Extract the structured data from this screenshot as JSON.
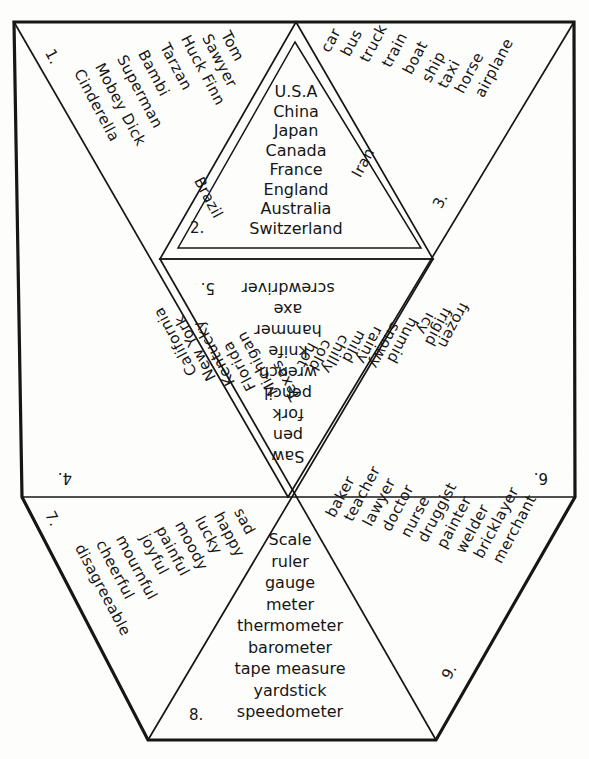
{
  "document": {
    "title": "Word Category Triangle Net Worksheet",
    "shape": "hexagon-net-of-triangles"
  },
  "panels": [
    {
      "id": "panel-1",
      "number": "1.",
      "category": "storybook-characters",
      "words": [
        "Tom",
        "Sawyer",
        "Huck Finn",
        "Tarzan",
        "Bambi",
        "Superman",
        "Mobey Dick",
        "Cinderella"
      ]
    },
    {
      "id": "panel-2",
      "number": "2.",
      "category": "countries",
      "words": [
        "U.S.A",
        "China",
        "Japan",
        "Canada",
        "France",
        "England",
        "Australia",
        "Switzerland"
      ],
      "edge_left": "Brazil",
      "edge_right": "Iran"
    },
    {
      "id": "panel-3",
      "number": "3.",
      "category": "transportation",
      "words": [
        "car",
        "bus",
        "truck",
        "train",
        "boat",
        "ship",
        "taxi",
        "horse",
        "airplane"
      ]
    },
    {
      "id": "panel-4",
      "number": "4.",
      "category": "states",
      "words": [
        "California",
        "New York",
        "Kentucky",
        "Florida",
        "Michigan",
        "Texas"
      ]
    },
    {
      "id": "panel-5",
      "number": "5.",
      "category": "tools",
      "words": [
        "screwdriver",
        "axe",
        "hammer",
        "knife",
        "wrench",
        "pencil",
        "fork",
        "pen",
        "Saw"
      ]
    },
    {
      "id": "panel-6",
      "number": "6.",
      "category": "weather",
      "words": [
        "frozen",
        "frigid",
        "icy",
        "humid",
        "snowy",
        "rainy",
        "mild",
        "chilly",
        "cold",
        "hot"
      ]
    },
    {
      "id": "panel-7",
      "number": "7.",
      "category": "feelings",
      "words": [
        "sad",
        "happy",
        "lucky",
        "moody",
        "painful",
        "joyful",
        "mournful",
        "cheerful",
        "disagreeable"
      ]
    },
    {
      "id": "panel-8",
      "number": "8.",
      "category": "measuring-instruments",
      "words": [
        "Scale",
        "ruler",
        "gauge",
        "meter",
        "thermometer",
        "barometer",
        "tape measure",
        "yardstick",
        "speedometer"
      ]
    },
    {
      "id": "panel-9",
      "number": "9.",
      "category": "occupations",
      "words": [
        "baker",
        "teacher",
        "lawyer",
        "doctor",
        "nurse",
        "druggist",
        "painter",
        "welder",
        "bricklayer",
        "merchant"
      ]
    }
  ],
  "panel1": {
    "number": "1.",
    "w0": "Tom",
    "w1": "Sawyer",
    "w2": "Huck Finn",
    "w3": "Tarzan",
    "w4": "Bambi",
    "w5": "Superman",
    "w6": "Mobey Dick",
    "w7": "Cinderella"
  },
  "panel2": {
    "number": "2.",
    "w0": "U.S.A",
    "w1": "China",
    "w2": "Japan",
    "w3": "Canada",
    "w4": "France",
    "w5": "England",
    "w6": "Australia",
    "w7": "Switzerland",
    "left": "Brazil",
    "right": "Iran"
  },
  "panel3": {
    "number": "3.",
    "w0": "car",
    "w1": "bus",
    "w2": "truck",
    "w3": "train",
    "w4": "boat",
    "w5": "ship",
    "w6": "taxi",
    "w7": "horse",
    "w8": "airplane"
  },
  "panel4": {
    "number": "4.",
    "w0": "California",
    "w1": "New York",
    "w2": "Kentucky",
    "w3": "Florida",
    "w4": "Michigan",
    "w5": "Texas"
  },
  "panel5": {
    "number": "5.",
    "w0": "screwdriver",
    "w1": "axe",
    "w2": "hammer",
    "w3": "knife",
    "w4": "wrench",
    "w5": "pencil",
    "w6": "fork",
    "w7": "pen",
    "w8": "Saw"
  },
  "panel6": {
    "number": "6.",
    "w0": "frozen",
    "w1": "frigid",
    "w2": "icy",
    "w3": "humid",
    "w4": "snowy",
    "w5": "rainy",
    "w6": "mild",
    "w7": "chilly",
    "w8": "cold",
    "w9": "hot"
  },
  "panel7": {
    "number": "7.",
    "w0": "sad",
    "w1": "happy",
    "w2": "lucky",
    "w3": "moody",
    "w4": "painful",
    "w5": "joyful",
    "w6": "mournful",
    "w7": "cheerful",
    "w8": "disagreeable"
  },
  "panel8": {
    "number": "8.",
    "w0": "Scale",
    "w1": "ruler",
    "w2": "gauge",
    "w3": "meter",
    "w4": "thermometer",
    "w5": "barometer",
    "w6": "tape measure",
    "w7": "yardstick",
    "w8": "speedometer"
  },
  "panel9": {
    "number": "9.",
    "w0": "baker",
    "w1": "teacher",
    "w2": "lawyer",
    "w3": "doctor",
    "w4": "nurse",
    "w5": "druggist",
    "w6": "painter",
    "w7": "welder",
    "w8": "bricklayer",
    "w9": "merchant"
  },
  "colors": {
    "ink": "#161616",
    "paper": "#fdfdfc"
  }
}
